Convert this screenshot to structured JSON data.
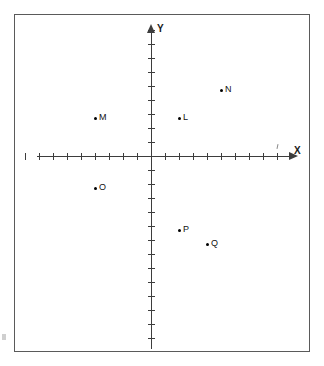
{
  "figure": {
    "kind": "coordinate-plane-diagram",
    "background_color": "#ffffff",
    "frame_color": "#5a5a5a",
    "axis_color": "#3d3d3d",
    "point_color": "#000000"
  },
  "axes": {
    "x_label": "X",
    "y_label": "Y",
    "origin_px": {
      "x": 150,
      "y": 155
    },
    "tick_spacing_px": 14,
    "x_ticks_negative": 9,
    "x_ticks_positive": 9,
    "y_ticks_positive": 9,
    "y_ticks_negative": 13,
    "x_range": [
      -9,
      9
    ],
    "y_range": [
      -13,
      9
    ],
    "grid": false
  },
  "chart_data": {
    "type": "scatter",
    "title": "",
    "xlabel": "X",
    "ylabel": "Y",
    "xlim": [
      -9,
      9
    ],
    "ylim": [
      -13,
      9
    ],
    "grid": false,
    "legend": "none",
    "labels": [
      "M",
      "L",
      "N",
      "O",
      "P",
      "Q"
    ],
    "x": [
      -4,
      2,
      5,
      -4,
      2,
      4
    ],
    "y": [
      3,
      3,
      5,
      -2,
      -5,
      -6
    ],
    "points": [
      {
        "label": "M",
        "x": -4,
        "y": 3,
        "label_side": "right"
      },
      {
        "label": "L",
        "x": 2,
        "y": 3,
        "label_side": "right"
      },
      {
        "label": "N",
        "x": 5,
        "y": 5,
        "label_side": "right"
      },
      {
        "label": "O",
        "x": -4,
        "y": -2,
        "label_side": "right"
      },
      {
        "label": "P",
        "x": 2,
        "y": -5,
        "label_side": "right"
      },
      {
        "label": "Q",
        "x": 4,
        "y": -6,
        "label_side": "right"
      }
    ]
  }
}
